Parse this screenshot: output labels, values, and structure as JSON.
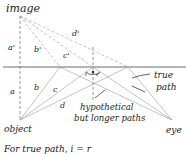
{
  "labels": {
    "image": "image",
    "object": "object",
    "eye": "eye",
    "true_path": [
      "true",
      "path"
    ],
    "hypothetical": [
      "hypothetical",
      "but longer paths"
    ],
    "a": "a",
    "b": "b",
    "c": "c",
    "d": "d",
    "a_prime": "a'",
    "b_prime": "b'",
    "c_prime": "c'",
    "d_prime": "d'",
    "i": "i",
    "r": "r",
    "caption": "For true path, i = r"
  },
  "colors": {
    "ink": "#222222",
    "ray": "#888888",
    "mirror": "#444444"
  }
}
